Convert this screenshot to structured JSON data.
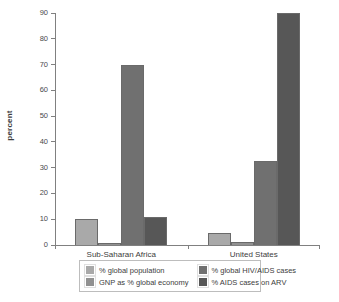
{
  "chart_data": {
    "type": "bar",
    "title": "",
    "subtitle": "",
    "xlabel": "",
    "ylabel": "percent",
    "ylim": [
      0,
      90
    ],
    "ytick_values": [
      0,
      10,
      20,
      30,
      40,
      50,
      60,
      70,
      80,
      90
    ],
    "ytick_labels": [
      "0",
      "10",
      "20",
      "30",
      "40",
      "50",
      "60",
      "70",
      "80",
      "90"
    ],
    "grid": false,
    "legend_position": "bottom",
    "categories": [
      "Sub-Saharan Africa",
      "United States"
    ],
    "series": [
      {
        "name": "% global population",
        "color": "#a9a9a9",
        "values": [
          10,
          4.5
        ]
      },
      {
        "name": "GNP as % global economy",
        "color": "#919191",
        "values": [
          0.6,
          1.3
        ]
      },
      {
        "name": "% global HIV/AIDS cases",
        "color": "#707070",
        "values": [
          70,
          32.5
        ]
      },
      {
        "name": "% AIDS cases on ARV",
        "color": "#575757",
        "values": [
          11,
          90
        ]
      }
    ]
  },
  "legend": {
    "items": [
      {
        "label": "% global population",
        "color": "#a9a9a9"
      },
      {
        "label": "% global HIV/AIDS cases",
        "color": "#707070"
      },
      {
        "label": "GNP as % global economy",
        "color": "#919191"
      },
      {
        "label": "% AIDS cases on ARV",
        "color": "#575757"
      }
    ]
  }
}
